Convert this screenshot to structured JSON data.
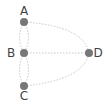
{
  "graph": {
    "nodes": [
      {
        "id": "A",
        "label": "A",
        "x": 24,
        "y": 22,
        "lx": 24,
        "ly": 15,
        "anchor": "middle"
      },
      {
        "id": "B",
        "label": "B",
        "x": 24,
        "y": 53,
        "lx": 11,
        "ly": 57,
        "anchor": "middle"
      },
      {
        "id": "C",
        "label": "C",
        "x": 24,
        "y": 86,
        "lx": 24,
        "ly": 100,
        "anchor": "middle"
      },
      {
        "id": "D",
        "label": "D",
        "x": 89,
        "y": 53,
        "lx": 98,
        "ly": 57,
        "anchor": "middle"
      }
    ],
    "edges": [
      {
        "from": "A",
        "to": "B",
        "curve": "left"
      },
      {
        "from": "A",
        "to": "B",
        "curve": "right"
      },
      {
        "from": "B",
        "to": "C",
        "curve": "left"
      },
      {
        "from": "B",
        "to": "C",
        "curve": "right"
      },
      {
        "from": "A",
        "to": "D",
        "curve": "arc"
      },
      {
        "from": "B",
        "to": "D",
        "curve": "straight"
      },
      {
        "from": "C",
        "to": "D",
        "curve": "arc"
      }
    ],
    "colors": {
      "node": "#777777",
      "edge": "#c8c8c8",
      "label": "#444444"
    }
  }
}
